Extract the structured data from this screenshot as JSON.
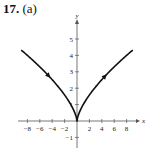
{
  "problem": {
    "number": "17.",
    "part": "(a)"
  },
  "chart_data": {
    "type": "line",
    "title": "",
    "xlabel": "x",
    "ylabel": "y",
    "xlim": [
      -9,
      9.5
    ],
    "ylim": [
      -1.5,
      5.8
    ],
    "x_ticks": [
      -8,
      -6,
      -4,
      -2,
      2,
      4,
      6,
      8
    ],
    "x_tick_labels": [
      "−8",
      "−6",
      "−4",
      "−2",
      "2",
      "4",
      "6",
      "8"
    ],
    "y_ticks": [
      -1,
      1,
      2,
      3,
      4,
      5
    ],
    "y_tick_labels": [
      "−1",
      "1",
      "2",
      "3",
      "4",
      "5"
    ],
    "grid": false,
    "legend": null,
    "series": [
      {
        "name": "curve (y = x^(2/3), cusp at origin)",
        "x": [
          -9,
          -8,
          -6,
          -4,
          -2,
          -1,
          0,
          1,
          2,
          4,
          6,
          8,
          9
        ],
        "y": [
          4.33,
          4.0,
          3.3,
          2.52,
          1.59,
          1.0,
          0,
          1.0,
          1.59,
          2.52,
          3.3,
          4.0,
          4.33
        ],
        "direction": "arrows indicate motion from upper-left toward origin, then out to upper-right"
      }
    ],
    "annotations": [
      "direction arrow near (-4, 2.5)",
      "direction arrow near (4.5, 2.7)"
    ]
  },
  "colors": {
    "curve": "#111111",
    "axes": "#555555",
    "text": "#222222"
  }
}
